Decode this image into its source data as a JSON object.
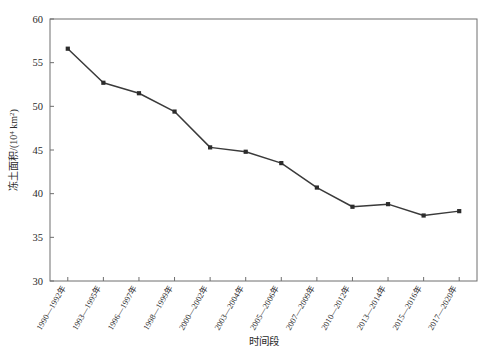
{
  "chart_data": {
    "type": "line",
    "title": "",
    "xlabel": "时间段",
    "ylabel": "冻土面积/(10⁴ km²)",
    "ylabel_parts": {
      "prefix": "冻土面积/(10",
      "exponent": "4",
      "suffix": " km",
      "unit_exponent": "2",
      "close": ")"
    },
    "categories": [
      "1990—1992年",
      "1993—1995年",
      "1996—1997年",
      "1998—1999年",
      "2000—2002年",
      "2003—2004年",
      "2005—2006年",
      "2007—2009年",
      "2010—2012年",
      "2013—2014年",
      "2015—2016年",
      "2017—2020年"
    ],
    "values": [
      56.6,
      52.7,
      51.5,
      49.4,
      45.3,
      44.8,
      43.5,
      40.7,
      38.5,
      38.8,
      37.5,
      38.0
    ],
    "ylim": [
      30,
      60
    ],
    "yticks": [
      30,
      35,
      40,
      45,
      50,
      55,
      60
    ],
    "ytick_labels": [
      "30",
      "35",
      "40",
      "45",
      "50",
      "55",
      "60"
    ],
    "grid": false,
    "legend": false,
    "legend_position": "none",
    "marker": "square",
    "line_color": "#3a3a3a",
    "marker_color": "#2c2c2c",
    "axis_color": "#6e6e6e"
  }
}
